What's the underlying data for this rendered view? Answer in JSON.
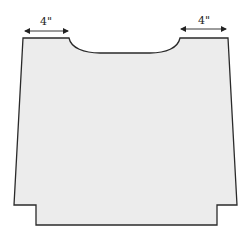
{
  "diagram": {
    "colors": {
      "panel_fill": "#ececec",
      "outline": "#2a2a2a",
      "arrow": "#222222"
    },
    "dimensions": [
      {
        "id": "left-shoulder",
        "label": "4\""
      },
      {
        "id": "right-shoulder",
        "label": "4\""
      }
    ]
  }
}
